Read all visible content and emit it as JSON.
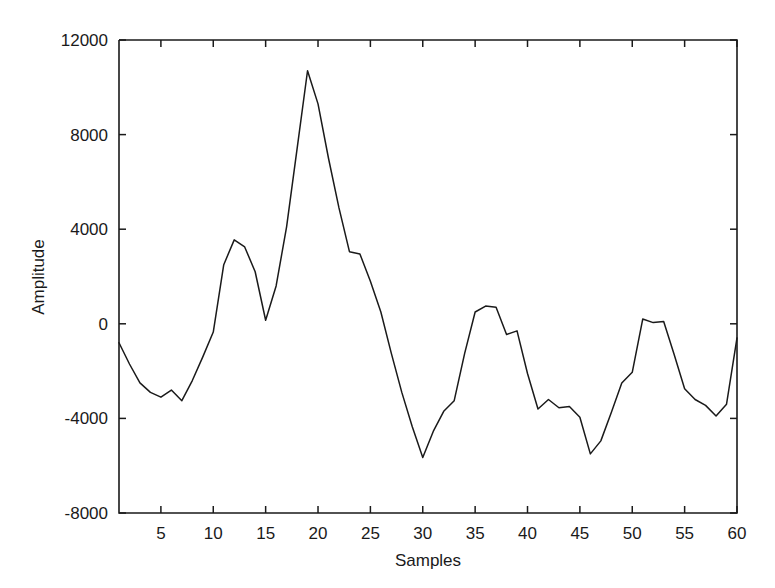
{
  "figure": {
    "background_color": "#ffffff",
    "line_color": "#1a1a1a",
    "axis_color": "#1a1a1a"
  },
  "chart_data": {
    "type": "line",
    "title": "",
    "xlabel": "Samples",
    "ylabel": "Amplitude",
    "xlim": [
      1,
      60
    ],
    "ylim": [
      -8000,
      12000
    ],
    "grid": false,
    "legend": null,
    "xticks": [
      5,
      10,
      15,
      20,
      25,
      30,
      35,
      40,
      45,
      50,
      55,
      60
    ],
    "xtick_labels": [
      "5",
      "10",
      "15",
      "20",
      "25",
      "30",
      "35",
      "40",
      "45",
      "50",
      "55",
      "60"
    ],
    "yticks": [
      -8000,
      -4000,
      0,
      4000,
      8000,
      12000
    ],
    "ytick_labels": [
      "-8000",
      "-4000",
      "0",
      "4000",
      "8000",
      "12000"
    ],
    "series": [
      {
        "name": "Amplitude",
        "color": "#1a1a1a",
        "x": [
          1,
          2,
          3,
          4,
          5,
          6,
          7,
          8,
          9,
          10,
          11,
          12,
          13,
          14,
          15,
          16,
          17,
          18,
          19,
          20,
          21,
          22,
          23,
          24,
          25,
          26,
          27,
          28,
          29,
          30,
          31,
          32,
          33,
          34,
          35,
          36,
          37,
          38,
          39,
          40,
          41,
          42,
          43,
          44,
          45,
          46,
          47,
          48,
          49,
          50,
          51,
          52,
          53,
          54,
          55,
          56,
          57,
          58,
          59,
          60
        ],
        "values": [
          -800,
          -1700,
          -2500,
          -2900,
          -3100,
          -2800,
          -3250,
          -2400,
          -1400,
          -350,
          2500,
          3550,
          3250,
          2200,
          150,
          1600,
          4100,
          7400,
          10700,
          9300,
          7000,
          4900,
          3050,
          2950,
          1800,
          500,
          -1250,
          -2900,
          -4350,
          -5650,
          -4550,
          -3700,
          -3250,
          -1250,
          500,
          750,
          700,
          -450,
          -300,
          -2100,
          -3600,
          -3200,
          -3550,
          -3500,
          -3950,
          -5500,
          -4950,
          -3750,
          -2500,
          -2050,
          200,
          50,
          100,
          -1300,
          -2750,
          -3200,
          -3450,
          -3900,
          -3400,
          -600
        ]
      }
    ]
  },
  "axis": {
    "ylabel_text": "Amplitude",
    "xlabel_text": "Samples"
  }
}
